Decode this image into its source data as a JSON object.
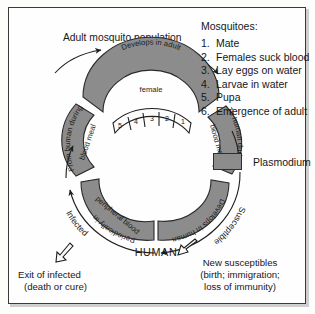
{
  "figure": {
    "title_top": "Adult mosquito population",
    "human_label": "HUMAN"
  },
  "mosquito_panel": {
    "heading": "Mosquitoes:",
    "items": [
      {
        "num": "1.",
        "text": "Mate"
      },
      {
        "num": "2.",
        "text": "Females suck blood"
      },
      {
        "num": "3.",
        "text": "Lay eggs on water"
      },
      {
        "num": "4.",
        "text": "Larvae in water"
      },
      {
        "num": "5.",
        "text": "Pupa"
      },
      {
        "num": "6.",
        "text": "Emergence of adult"
      }
    ]
  },
  "legend": {
    "swatch_label": "Plasmodium",
    "swatch_color": "#8c8c8c"
  },
  "cycle": {
    "segments": {
      "mosquito_develop_l1": "Develops in adult",
      "mosquito_develop_l2": "female",
      "to_human_l1": "To human during",
      "to_human_l2": "blood meal",
      "from_human_l1": "From human during",
      "from_human_l2": "blood meal",
      "develops_in_human": "Develops in human",
      "peripheral_l1": "Periodically in",
      "peripheral_l2": "peripheral blood"
    },
    "stage_numbers": [
      "5",
      "4",
      "3",
      "2",
      "1"
    ],
    "outer_labels": {
      "infected": "Infected",
      "susceptible": "Susceptible"
    }
  },
  "notes": {
    "exit_l1": "Exit of infected",
    "exit_l2": "(death or cure)",
    "new_l1": "New susceptibles",
    "new_l2": "(birth; immigration;",
    "new_l3": "loss of immunity)"
  }
}
